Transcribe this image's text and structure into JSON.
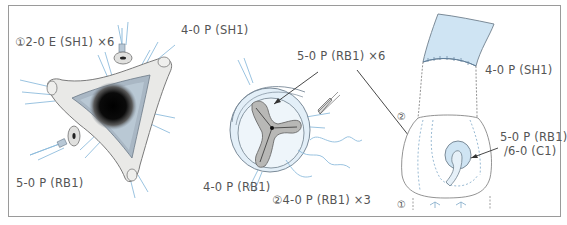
{
  "figure": {
    "colors": {
      "frame": "#9a9a9a",
      "tissue_fill": "#e8e8e6",
      "tissue_stroke": "#7a7a7a",
      "graft_blue": "#cfe4f3",
      "suture_blue": "#7fb2d6",
      "valve_gray": "#b9b9b7",
      "text": "#555555"
    },
    "panel_left": {
      "labels": {
        "pledget_sutures": "①2-0 E (SH1) ×6",
        "top_right": "4-0 P (SH1)",
        "bottom_left": "5-0 P (RB1)"
      }
    },
    "panel_middle": {
      "labels": {
        "top": "5-0 P (RB1) ×6",
        "bottom_left": "4-0 P (RB1)",
        "bottom_right": "②4-0 P (RB1) ×3"
      }
    },
    "panel_right": {
      "labels": {
        "graft_suture": "4-0 P (SH1)",
        "step2_marker": "②",
        "step1_marker": "①",
        "coronary_line1": "5-0 P (RB1)",
        "coronary_line2": "/6-0 (C1)"
      }
    }
  }
}
